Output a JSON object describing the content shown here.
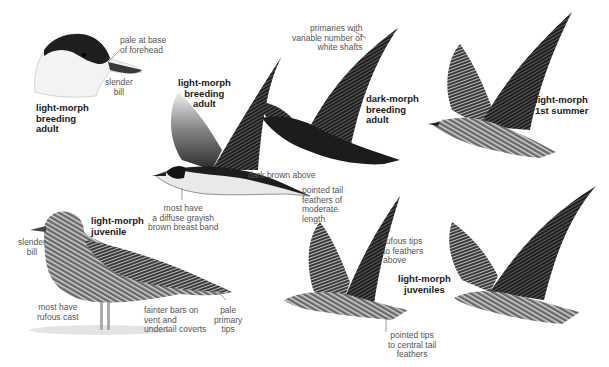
{
  "plate": {
    "subject": "jaeger identification plate",
    "figures": [
      {
        "id": "head",
        "title": "light-morph\nbreeding\nadult",
        "annotations": [
          "pale at base\nof forehead",
          "slender\nbill"
        ]
      },
      {
        "id": "light-adult-flight",
        "title": "light-morph\nbreeding\nadult",
        "annotations": [
          "dark brown above",
          "most have\na diffuse grayish\nbrown breast band",
          "pointed tail\nfeathers of\nmoderate\nlength"
        ]
      },
      {
        "id": "dark-adult-flight",
        "title": "dark-morph\nbreeding\nadult",
        "annotations": [
          "primaries with\nvariable number of\nwhite shafts"
        ]
      },
      {
        "id": "first-summer",
        "title": "light-morph\n1st summer",
        "annotations": []
      },
      {
        "id": "juvenile-standing",
        "title": "light-morph\njuvenile",
        "annotations": [
          "slender\nbill",
          "most have\nrufous cast",
          "fainter bars on\nvent and\nundertail coverts",
          "pale\nprimary\ntips"
        ]
      },
      {
        "id": "juveniles-flight",
        "title": "light-morph\njuveniles",
        "annotations": [
          "rufous tips\nto feathers\nabove",
          "pointed tips\nto central tail\nfeathers"
        ]
      }
    ]
  },
  "colors": {
    "background": "#ffffff",
    "label_text": "#555555",
    "title_text": "#1a1a1a",
    "dark_plumage": "#1c1c1c",
    "mid_plumage": "#5a5a5a",
    "pale_plumage": "#e8e8e8"
  }
}
